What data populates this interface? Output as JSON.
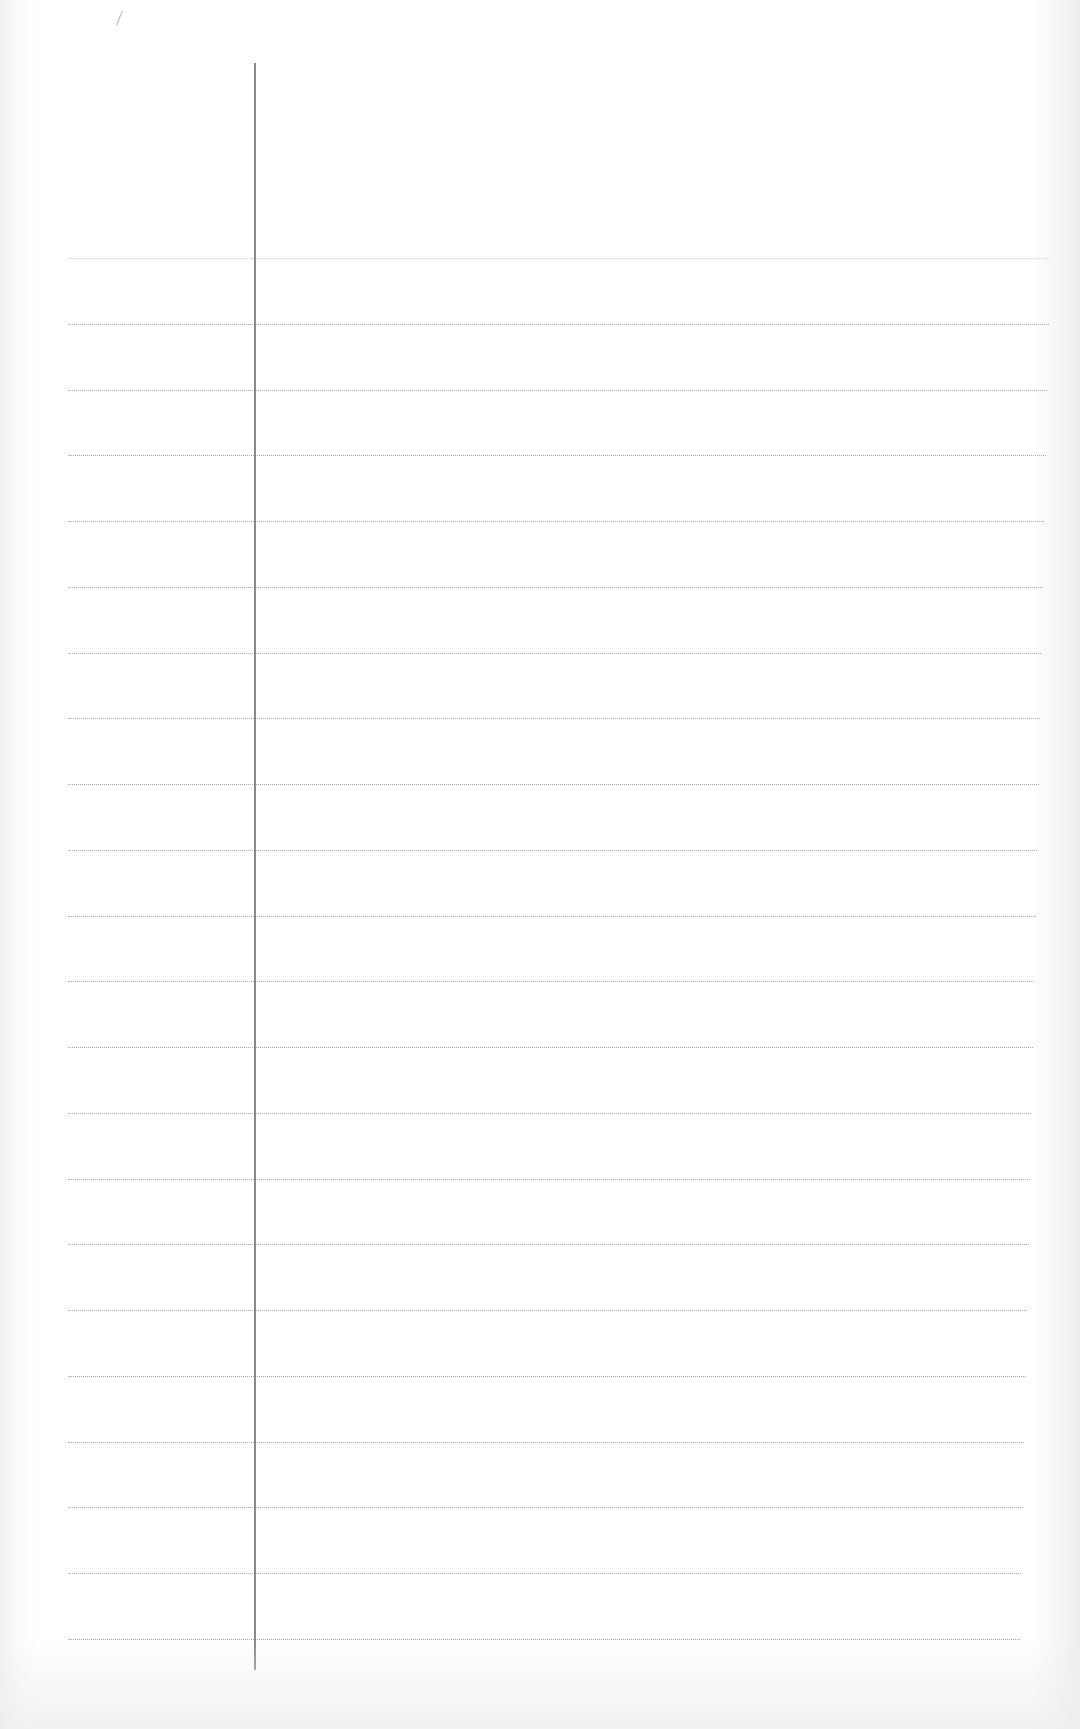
{
  "page": {
    "type": "lined-notebook-paper",
    "width": 1080,
    "height": 1729,
    "background_color": "#ffffff",
    "rule_color": "#a8a8a8",
    "margin_line_color": "#8a8a8a"
  },
  "margin_line": {
    "x": 254,
    "top": 63,
    "bottom": 1670
  },
  "rules": {
    "count": 22,
    "first_y": 258,
    "spacing": 65.75,
    "left_x": 68,
    "right_x_top": 1050,
    "right_x_bottom": 1020,
    "first_rule_faint": true
  },
  "text_content": []
}
